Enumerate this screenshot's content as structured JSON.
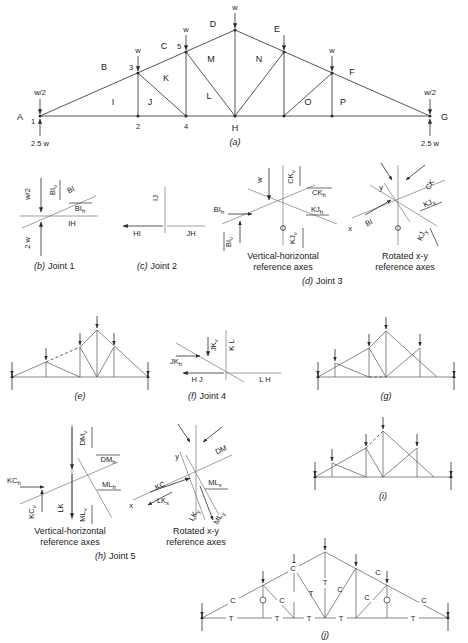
{
  "figure": {
    "panels": [
      "a",
      "b",
      "c",
      "d",
      "e",
      "f",
      "g",
      "h",
      "i",
      "j"
    ]
  },
  "panel_a": {
    "caption": "(a)",
    "joint_numbers": [
      "1",
      "2",
      "3",
      "4",
      "5"
    ],
    "upper_chord_labels": [
      "B",
      "C",
      "D",
      "E",
      "F"
    ],
    "support_left_label": "A",
    "support_right_label": "G",
    "bottom_chord_label": "H",
    "interior_labels": [
      "I",
      "J",
      "K",
      "L",
      "M",
      "N",
      "O",
      "P"
    ],
    "loads": {
      "half_left": "w/2",
      "half_right": "w/2",
      "full": "w",
      "reaction_left": "2.5 w",
      "reaction_right": "2.5 w"
    },
    "panel_point_loads": [
      "w",
      "w",
      "w",
      "w"
    ]
  },
  "panel_b": {
    "caption": "(b)  Joint 1",
    "caption_letter": "(b)",
    "caption_text": "Joint 1",
    "load_label": "w/2",
    "reaction_label": "2 w",
    "member_labels": [
      "BI",
      "BI_v",
      "BI_h",
      "IH"
    ],
    "bi": "BI",
    "bi_v": "BI",
    "bi_v_sub": "v",
    "bi_h": "BI",
    "bi_h_sub": "h",
    "ih": "IH"
  },
  "panel_c": {
    "caption": "(c)  Joint 2",
    "caption_letter": "(c)",
    "caption_text": "Joint 2",
    "vertical_label": "IJ",
    "left_label": "HI",
    "right_label": "JH"
  },
  "panel_d": {
    "caption": "(d)  Joint 3",
    "caption_letter": "(d)",
    "caption_text": "Joint 3",
    "left_subcaption_line1": "Vertical-horizontal",
    "left_subcaption_line2": "reference axes",
    "right_subcaption_line1": "Rotated x-y",
    "right_subcaption_line2": "reference axes",
    "left": {
      "load": "w",
      "labels": [
        "BI_h",
        "BI_v",
        "CK_v",
        "CK_h",
        "KJ_h",
        "KJ_v"
      ],
      "bi_h": "BI",
      "bi_h_sub": "h",
      "bi_v": "BI",
      "bi_v_sub": "v",
      "ck_v": "CK",
      "ck_v_sub": "v",
      "ck_h": "CK",
      "ck_h_sub": "h",
      "kj_h": "KJ",
      "kj_h_sub": "h",
      "kj_v": "KJ",
      "kj_v_sub": "v"
    },
    "right": {
      "axis_x": "x",
      "axis_y": "y",
      "labels": [
        "BI",
        "CK",
        "KJ_x",
        "KJ_y"
      ],
      "bi": "BI",
      "ck": "CK",
      "kj_x": "KJ",
      "kj_x_sub": "x",
      "kj_y": "KJ",
      "kj_y_sub": "y"
    }
  },
  "panel_e": {
    "caption": "(e)"
  },
  "panel_f": {
    "caption": "(f)  Joint 4",
    "caption_letter": "(f)",
    "caption_text": "Joint 4",
    "jk_v": "JK",
    "jk_v_sub": "v",
    "jk_h": "JK",
    "jk_h_sub": "h",
    "kl": "K L",
    "hj": "H J",
    "lh": "L H"
  },
  "panel_g": {
    "caption": "(g)"
  },
  "panel_h": {
    "caption": "(h)  Joint 5",
    "caption_letter": "(h)",
    "caption_text": "Joint 5",
    "left_subcaption_line1": "Vertical-horizontal",
    "left_subcaption_line2": "reference axes",
    "right_subcaption_line1": "Rotated x-y",
    "right_subcaption_line2": "reference axes",
    "left": {
      "kc_h": "KC",
      "kc_h_sub": "h",
      "kc_v": "KC",
      "kc_v_sub": "v",
      "dm_v": "DM",
      "dm_v_sub": "v",
      "dm_h": "DM",
      "dm_h_sub": "h",
      "ml_h": "ML",
      "ml_h_sub": "h",
      "ml_v": "ML",
      "ml_v_sub": "v",
      "lk": "LK"
    },
    "right": {
      "axis_x": "x",
      "axis_y": "y",
      "kc": "KC",
      "dm": "DM",
      "ml_x": "ML",
      "ml_x_sub": "x",
      "ml_y": "ML",
      "ml_y_sub": "y",
      "lk_x": "LK",
      "lk_x_sub": "x",
      "lk_y": "LK",
      "lk_y_sub": "y"
    }
  },
  "panel_i": {
    "caption": "(i)"
  },
  "panel_j": {
    "caption": "(j)",
    "tension_symbol": "T",
    "compression_symbol": "C",
    "bottom_chord_forces": [
      "T",
      "T",
      "T",
      "T",
      "T"
    ],
    "top_chord_forces": [
      "C",
      "C",
      "C",
      "C"
    ],
    "web_forces": [
      "C",
      "T",
      "C",
      "T",
      "C",
      "C"
    ],
    "zero_force_symbol": "0"
  },
  "colors": {
    "ink": "#1a1a1a",
    "member": "#2b2b2b",
    "light_line": "#777777"
  }
}
